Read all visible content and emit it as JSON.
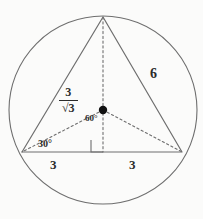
{
  "figure": {
    "background_color": "#fbfbfa",
    "stroke_color": "#6e6e6e",
    "text_color": "#2b2b2b",
    "width": 203,
    "height": 219
  },
  "circle": {
    "name": "circumcircle",
    "center_x": 103,
    "center_y": 110,
    "radius": 94,
    "style": "solid"
  },
  "triangle": {
    "name": "equilateral-triangle",
    "style": "solid",
    "vertices": {
      "apex": {
        "x": 103,
        "y": 17
      },
      "bottom_left": {
        "x": 22,
        "y": 152
      },
      "bottom_right": {
        "x": 182,
        "y": 152
      }
    }
  },
  "center_point": {
    "name": "circumcenter-dot",
    "x": 103,
    "y": 110,
    "radius": 4
  },
  "construction_lines": [
    {
      "name": "altitude",
      "style": "dashed",
      "x1": 103,
      "y1": 17,
      "x2": 103,
      "y2": 152
    },
    {
      "name": "radius-to-bottom-left",
      "style": "dashed",
      "x1": 103,
      "y1": 110,
      "x2": 22,
      "y2": 152
    },
    {
      "name": "radius-to-bottom-right",
      "style": "dashed",
      "x1": 103,
      "y1": 110,
      "x2": 182,
      "y2": 152
    }
  ],
  "right_angle_marker": {
    "name": "right-angle-square",
    "x": 91,
    "y": 140,
    "size": 12
  },
  "labels": {
    "side_length": "6",
    "base_left_half": "3",
    "base_right_half": "3",
    "center_angle": "60°",
    "base_angle": "30°",
    "inradius": {
      "numerator": "3",
      "denominator_radical": "√",
      "denominator_value": "3",
      "text": "3/√3"
    }
  }
}
